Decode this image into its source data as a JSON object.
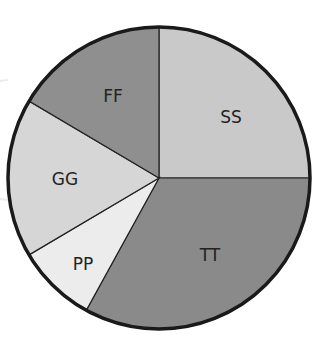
{
  "chart_data": {
    "type": "pie",
    "title": "",
    "start_angle_deg": 0,
    "direction": "clockwise",
    "categories": [
      "SS",
      "TT",
      "PP",
      "GG",
      "FF"
    ],
    "values": [
      25,
      33,
      8.5,
      17,
      16.5
    ],
    "colors": [
      "#c9c9c9",
      "#8a8a8a",
      "#ececec",
      "#d6d6d6",
      "#8f8f8f"
    ],
    "legend": "none",
    "labels_inside": true
  },
  "labels": {
    "ss": "SS",
    "tt": "TT",
    "pp": "PP",
    "gg": "GG",
    "ff": "FF"
  }
}
